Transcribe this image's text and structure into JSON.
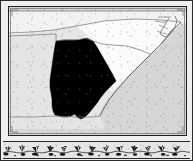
{
  "plate": {
    "kind": "engraved-map-plate",
    "background_color": "#e9e9e9",
    "edge_color": "#2b2b2b"
  },
  "map": {
    "frame": {
      "border_color": "#1e1e1e",
      "inner_rule_color": "#8d8d8d",
      "water_color": "#d6d6d6"
    },
    "region": "Southeastern United States",
    "highlight_color": "#000000",
    "unhighlighted_color": "#fbfbfb",
    "boundary_color": "#6f6f6f",
    "coastline_color": "#4a4a4a",
    "areas": [
      {
        "name": "Georgia",
        "role": "highlighted-state",
        "fill": "#000000"
      },
      {
        "name": "South Carolina",
        "role": "neighbor-state",
        "fill": "#fbfbfb"
      },
      {
        "name": "North Carolina",
        "role": "neighbor-state",
        "fill": "#fbfbfb"
      },
      {
        "name": "Tennessee",
        "role": "neighbor-state",
        "fill": "#f2f2f2"
      },
      {
        "name": "Alabama",
        "role": "neighbor-state",
        "fill": "#e4e4e4"
      },
      {
        "name": "Florida",
        "role": "neighbor-state",
        "fill": "#e4e4e4"
      },
      {
        "name": "Atlantic Ocean",
        "role": "water",
        "fill": "#d6d6d6"
      }
    ],
    "features": [
      {
        "name": "Outer Banks",
        "type": "barrier-islands"
      },
      {
        "name": "Pamlico Sound",
        "type": "sound"
      },
      {
        "name": "Albemarle Sound",
        "type": "sound"
      }
    ]
  },
  "ornament": {
    "style": "leafy-vine-border",
    "band_color": "#e2e2e2",
    "rule_color": "#2a2a2a",
    "motif_color": "#1a1a1a",
    "sprig_count": 13
  }
}
